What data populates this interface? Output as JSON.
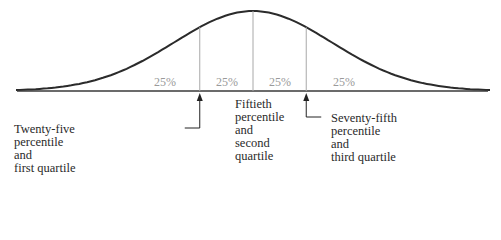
{
  "diagram": {
    "segments": [
      {
        "label": "25%"
      },
      {
        "label": "25%"
      },
      {
        "label": "25%"
      },
      {
        "label": "25%"
      }
    ],
    "markers": [
      {
        "z": -0.674,
        "name": "first-quartile",
        "arrow": true
      },
      {
        "z": 0,
        "name": "median",
        "arrow": false
      },
      {
        "z": 0.674,
        "name": "third-quartile",
        "arrow": true
      }
    ],
    "annotations": {
      "q1": [
        "Twenty-five",
        "percentile",
        "and",
        "first quartile"
      ],
      "median": [
        "Fiftieth",
        "percentile",
        "and",
        "second",
        "quartile"
      ],
      "q3": [
        "Seventy-fifth",
        "percentile",
        "and",
        "third quartile"
      ]
    },
    "colors": {
      "curve": "#2b2b2b",
      "baseline": "#3a3a3a",
      "divider": "#a8a8a8",
      "percent_text": "#9a9a9a",
      "label_text": "#2a2a2a"
    }
  }
}
